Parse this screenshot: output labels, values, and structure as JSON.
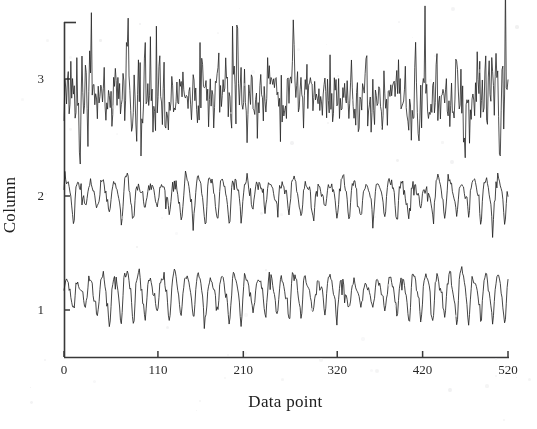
{
  "figure": {
    "background_color": "#fdfdfd",
    "ink_color": "#2b2b2b"
  },
  "axes": {
    "x_title": "Data point",
    "y_title": "Column",
    "x_ticks": [
      "0",
      "110",
      "210",
      "320",
      "420",
      "520"
    ],
    "y_ticks": [
      "1",
      "2",
      "3"
    ]
  },
  "chart_data": {
    "type": "line",
    "title": "",
    "xlabel": "Data point",
    "ylabel": "Column",
    "xlim": [
      0,
      520
    ],
    "ylim": [
      0.35,
      3.75
    ],
    "xticks": [
      0,
      110,
      210,
      320,
      420,
      520
    ],
    "yticks": [
      1,
      2,
      3
    ],
    "grid": false,
    "legend": "none",
    "series": [
      {
        "name": "Column 1",
        "baseline": 1.0,
        "period_points": 14,
        "amplitude": 0.17,
        "noise_amplitude": 0.05,
        "seed": 11,
        "kind": "periodic"
      },
      {
        "name": "Column 2",
        "baseline": 2.0,
        "period_points": 14,
        "amplitude": 0.16,
        "noise_amplitude": 0.05,
        "seed": 29,
        "kind": "periodic"
      },
      {
        "name": "Column 3",
        "baseline": 3.0,
        "period_points": 1,
        "amplitude": 0.0,
        "noise_amplitude": 0.27,
        "seed": 47,
        "kind": "noise"
      }
    ],
    "n_points": 520
  },
  "geometry": {
    "plot_left": 64,
    "plot_right": 508,
    "plot_top": 22,
    "plot_bottom": 357,
    "y_pixel_for_1": 310,
    "y_pixel_for_2": 196,
    "y_pixel_for_3": 79
  }
}
